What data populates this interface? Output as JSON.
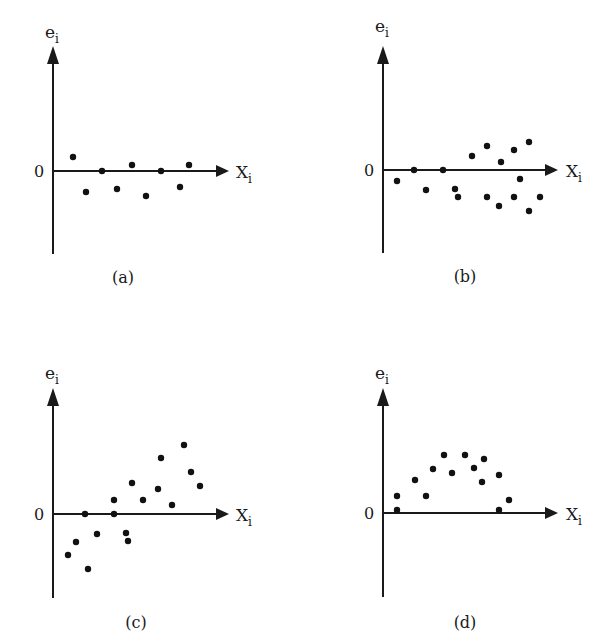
{
  "chart_data": [
    {
      "type": "scatter",
      "panel": "(a)",
      "title": "(a)",
      "xlabel": "X_i",
      "ylabel": "e_i",
      "zero_label": "0",
      "grid": false,
      "description": "Residuals randomly scattered in a constant-width band around zero",
      "points_px": [
        [
          73,
          157
        ],
        [
          86,
          192
        ],
        [
          102,
          171
        ],
        [
          117,
          189
        ],
        [
          132,
          165
        ],
        [
          146,
          196
        ],
        [
          161,
          171
        ],
        [
          180,
          187
        ],
        [
          189,
          165
        ]
      ],
      "points": [
        [
          1.0,
          0.7
        ],
        [
          1.7,
          -1.0
        ],
        [
          2.5,
          0.0
        ],
        [
          3.2,
          -0.9
        ],
        [
          4.0,
          0.3
        ],
        [
          4.6,
          -1.2
        ],
        [
          5.4,
          0.0
        ],
        [
          6.3,
          -0.8
        ],
        [
          6.8,
          0.3
        ]
      ]
    },
    {
      "type": "scatter",
      "panel": "(b)",
      "title": "(b)",
      "xlabel": "X_i",
      "ylabel": "e_i",
      "zero_label": "0",
      "grid": false,
      "description": "Residual spread increases with X_i (funnel / heteroscedastic)",
      "points_px": [
        [
          397,
          181
        ],
        [
          414,
          170
        ],
        [
          426,
          190
        ],
        [
          443,
          170
        ],
        [
          455,
          189
        ],
        [
          458,
          197
        ],
        [
          472,
          156
        ],
        [
          487,
          146
        ],
        [
          487,
          197
        ],
        [
          499,
          206
        ],
        [
          501,
          162
        ],
        [
          514,
          150
        ],
        [
          520,
          179
        ],
        [
          514,
          197
        ],
        [
          529,
          142
        ],
        [
          529,
          211
        ],
        [
          540,
          197
        ]
      ],
      "points": [
        [
          0.7,
          -0.5
        ],
        [
          1.5,
          0.0
        ],
        [
          2.1,
          -1.0
        ],
        [
          3.0,
          0.0
        ],
        [
          3.6,
          -0.9
        ],
        [
          3.7,
          -1.3
        ],
        [
          4.4,
          0.7
        ],
        [
          5.2,
          1.2
        ],
        [
          5.2,
          -1.3
        ],
        [
          5.8,
          -1.8
        ],
        [
          5.9,
          0.4
        ],
        [
          6.5,
          1.0
        ],
        [
          6.8,
          -0.4
        ],
        [
          6.5,
          -1.3
        ],
        [
          7.3,
          1.4
        ],
        [
          7.3,
          -2.0
        ],
        [
          7.8,
          -1.3
        ]
      ]
    },
    {
      "type": "scatter",
      "panel": "(c)",
      "title": "(c)",
      "xlabel": "X_i",
      "ylabel": "e_i",
      "zero_label": "0",
      "grid": false,
      "description": "Residuals trend upward linearly with X_i",
      "points_px": [
        [
          68,
          555
        ],
        [
          76,
          542
        ],
        [
          85,
          514
        ],
        [
          88,
          569
        ],
        [
          97,
          534
        ],
        [
          114,
          500
        ],
        [
          114,
          514
        ],
        [
          126,
          533
        ],
        [
          128,
          541
        ],
        [
          132,
          483
        ],
        [
          143,
          500
        ],
        [
          158,
          489
        ],
        [
          161,
          458
        ],
        [
          172,
          505
        ],
        [
          184,
          445
        ],
        [
          191,
          472
        ],
        [
          200,
          486
        ]
      ],
      "points": [
        [
          0.7,
          -2.0
        ],
        [
          1.1,
          -1.4
        ],
        [
          1.6,
          0.0
        ],
        [
          1.7,
          -2.7
        ],
        [
          2.2,
          -1.0
        ],
        [
          3.0,
          0.7
        ],
        [
          3.0,
          0.0
        ],
        [
          3.7,
          -0.9
        ],
        [
          3.8,
          -1.3
        ],
        [
          4.0,
          1.5
        ],
        [
          4.5,
          0.7
        ],
        [
          5.3,
          1.2
        ],
        [
          5.4,
          2.8
        ],
        [
          6.0,
          0.4
        ],
        [
          6.6,
          3.4
        ],
        [
          6.9,
          2.1
        ],
        [
          7.4,
          1.4
        ]
      ]
    },
    {
      "type": "scatter",
      "panel": "(d)",
      "title": "(d)",
      "xlabel": "X_i",
      "ylabel": "e_i",
      "zero_label": "0",
      "grid": false,
      "description": "Residuals follow an inverted-U (curvilinear) pattern above zero",
      "points_px": [
        [
          397,
          496
        ],
        [
          397,
          510
        ],
        [
          415,
          480
        ],
        [
          426,
          496
        ],
        [
          433,
          469
        ],
        [
          444,
          455
        ],
        [
          452,
          473
        ],
        [
          465,
          455
        ],
        [
          474,
          468
        ],
        [
          482,
          482
        ],
        [
          484,
          459
        ],
        [
          499,
          475
        ],
        [
          499,
          510
        ],
        [
          509,
          500
        ]
      ],
      "points": [
        [
          0.7,
          0.8
        ],
        [
          0.7,
          0.15
        ],
        [
          1.6,
          1.6
        ],
        [
          2.1,
          0.8
        ],
        [
          2.5,
          2.2
        ],
        [
          3.0,
          2.9
        ],
        [
          3.4,
          2.0
        ],
        [
          4.1,
          2.9
        ],
        [
          4.5,
          2.2
        ],
        [
          4.9,
          1.5
        ],
        [
          5.0,
          2.7
        ],
        [
          5.8,
          1.9
        ],
        [
          5.8,
          0.15
        ],
        [
          6.3,
          0.65
        ]
      ]
    }
  ],
  "panels": [
    {
      "id": "a",
      "caption": "(a)",
      "ylabel_main": "e",
      "ylabel_sub": "i",
      "xlabel_main": "X",
      "xlabel_sub": "i",
      "zero": "0"
    },
    {
      "id": "b",
      "caption": "(b)",
      "ylabel_main": "e",
      "ylabel_sub": "i",
      "xlabel_main": "X",
      "xlabel_sub": "i",
      "zero": "0"
    },
    {
      "id": "c",
      "caption": "(c)",
      "ylabel_main": "e",
      "ylabel_sub": "i",
      "xlabel_main": "X",
      "xlabel_sub": "i",
      "zero": "0"
    },
    {
      "id": "d",
      "caption": "(d)",
      "ylabel_main": "e",
      "ylabel_sub": "i",
      "xlabel_main": "X",
      "xlabel_sub": "i",
      "zero": "0"
    }
  ],
  "colors": {
    "axis": "#1a1a1a",
    "dot": "#111111",
    "background": "#ffffff"
  }
}
